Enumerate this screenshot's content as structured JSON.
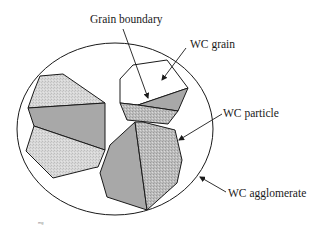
{
  "figure": {
    "labels": {
      "grain_boundary": "Grain boundary",
      "wc_grain": "WC grain",
      "wc_particle": "WC particle",
      "wc_agglomerate": "WC agglomerate"
    },
    "corner_mark": "mg"
  },
  "colors": {
    "outline": "#1a1a1a",
    "light_fill": "#d6d6d6",
    "dark_fill": "#a6a6a6",
    "hatched_fill": "#bdbdbd",
    "white_fill": "#ffffff"
  }
}
